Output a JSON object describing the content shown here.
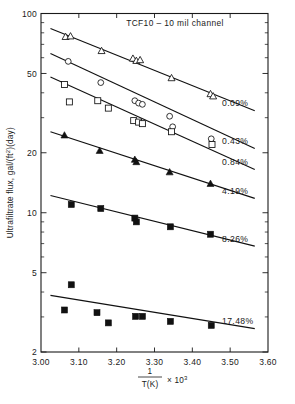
{
  "chart_data": {
    "type": "scatter",
    "title": "TCF10 – 10 mil channel",
    "xlabel": "1 / T(K)  × 10³",
    "xlabel_numerator": "1",
    "xlabel_denominator": "T(K)",
    "xlabel_multiplier": "× 10",
    "xlabel_exponent": "3",
    "ylabel": "Ultrafiltrate flux, gal/(ft²)(day)",
    "yscale": "log",
    "xscale": "linear",
    "xlim": [
      3.0,
      3.6
    ],
    "ylim": [
      2,
      100
    ],
    "grid": false,
    "legend_position": "right-inline",
    "xticks": [
      "3.00",
      "3.10",
      "3.20",
      "3.30",
      "3.40",
      "3.50",
      "3.60"
    ],
    "xtick_values": [
      3.0,
      3.1,
      3.2,
      3.3,
      3.4,
      3.5,
      3.6
    ],
    "yticks": [
      "100",
      "50",
      "20",
      "10",
      "5",
      "2"
    ],
    "ytick_values": [
      100,
      50,
      20,
      10,
      5,
      2
    ],
    "yminor_ticks": [
      3,
      4,
      6,
      7,
      8,
      9,
      30,
      40,
      60,
      70,
      80,
      90
    ],
    "series": [
      {
        "name": "0.09%",
        "label": "0.09%",
        "marker": "open-triangle",
        "fit_line": {
          "x": [
            3.025,
            3.565
          ],
          "y": [
            84.0,
            32.5
          ]
        },
        "points": [
          {
            "x": 3.065,
            "y": 76.5
          },
          {
            "x": 3.078,
            "y": 77.0
          },
          {
            "x": 3.16,
            "y": 65.0
          },
          {
            "x": 3.243,
            "y": 59.5
          },
          {
            "x": 3.252,
            "y": 58.0
          },
          {
            "x": 3.262,
            "y": 58.5
          },
          {
            "x": 3.345,
            "y": 47.5
          },
          {
            "x": 3.448,
            "y": 39.5
          },
          {
            "x": 3.455,
            "y": 38.5
          }
        ]
      },
      {
        "name": "0.43%",
        "label": "0.43%",
        "marker": "open-circle",
        "fit_line": {
          "x": [
            3.025,
            3.565
          ],
          "y": [
            63.0,
            21.0
          ]
        },
        "points": [
          {
            "x": 3.072,
            "y": 57.5
          },
          {
            "x": 3.158,
            "y": 45.0
          },
          {
            "x": 3.248,
            "y": 36.5
          },
          {
            "x": 3.258,
            "y": 35.5
          },
          {
            "x": 3.268,
            "y": 35.0
          },
          {
            "x": 3.34,
            "y": 30.5
          },
          {
            "x": 3.348,
            "y": 27.0
          },
          {
            "x": 3.45,
            "y": 23.5
          }
        ]
      },
      {
        "name": "0.84%",
        "label": "0.84%",
        "marker": "open-square",
        "fit_line": {
          "x": [
            3.025,
            3.565
          ],
          "y": [
            48.0,
            16.5
          ]
        },
        "points": [
          {
            "x": 3.062,
            "y": 44.0
          },
          {
            "x": 3.075,
            "y": 36.0
          },
          {
            "x": 3.15,
            "y": 36.5
          },
          {
            "x": 3.178,
            "y": 33.5
          },
          {
            "x": 3.245,
            "y": 29.0
          },
          {
            "x": 3.258,
            "y": 28.5
          },
          {
            "x": 3.268,
            "y": 28.0
          },
          {
            "x": 3.345,
            "y": 25.5
          },
          {
            "x": 3.452,
            "y": 22.0
          }
        ]
      },
      {
        "name": "4.19%",
        "label": "4.19%",
        "marker": "filled-triangle",
        "fit_line": {
          "x": [
            3.025,
            3.565
          ],
          "y": [
            25.5,
            11.8
          ]
        },
        "points": [
          {
            "x": 3.062,
            "y": 24.5
          },
          {
            "x": 3.155,
            "y": 20.5
          },
          {
            "x": 3.248,
            "y": 18.5
          },
          {
            "x": 3.252,
            "y": 18.0
          },
          {
            "x": 3.34,
            "y": 16.0
          },
          {
            "x": 3.448,
            "y": 14.0
          }
        ]
      },
      {
        "name": "8.26%",
        "label": "8.26%",
        "marker": "filled-square",
        "fit_line": {
          "x": [
            3.025,
            3.565
          ],
          "y": [
            12.2,
            6.8
          ]
        },
        "points": [
          {
            "x": 3.08,
            "y": 11.0
          },
          {
            "x": 3.158,
            "y": 10.5
          },
          {
            "x": 3.248,
            "y": 9.4
          },
          {
            "x": 3.252,
            "y": 9.0
          },
          {
            "x": 3.342,
            "y": 8.5
          },
          {
            "x": 3.448,
            "y": 7.8
          }
        ]
      },
      {
        "name": "17.48%",
        "label": "17.48%",
        "marker": "filled-square",
        "fit_line": {
          "x": [
            3.025,
            3.565
          ],
          "y": [
            3.85,
            2.62
          ]
        },
        "points": [
          {
            "x": 3.062,
            "y": 3.25
          },
          {
            "x": 3.08,
            "y": 4.35
          },
          {
            "x": 3.148,
            "y": 3.15
          },
          {
            "x": 3.178,
            "y": 2.8
          },
          {
            "x": 3.25,
            "y": 3.02
          },
          {
            "x": 3.268,
            "y": 3.02
          },
          {
            "x": 3.342,
            "y": 2.85
          },
          {
            "x": 3.45,
            "y": 2.72
          }
        ]
      }
    ]
  }
}
